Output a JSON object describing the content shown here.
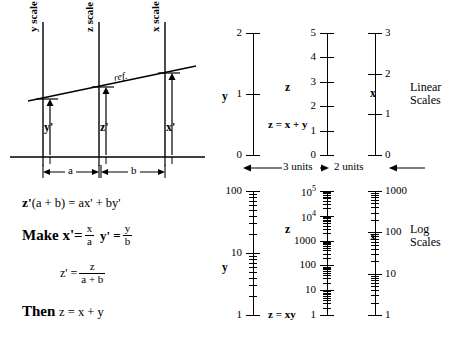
{
  "diagram": {
    "nomogram": {
      "scale_axis_labels": [
        {
          "text": "y scale",
          "variable": "y"
        },
        {
          "text": "z scale",
          "variable": "z"
        },
        {
          "text": "x scale",
          "variable": "x"
        }
      ],
      "reference_line_label": "ref.",
      "arrow_labels": [
        "y'",
        "z'",
        "x'"
      ],
      "dimension_labels": [
        "a",
        "b"
      ]
    },
    "equations": [
      {
        "id": "eq1",
        "text": "z'(a + b) = ax' + by'"
      },
      {
        "id": "eq2",
        "lead": "Make",
        "text": "x'= x/a   y' = y/b"
      },
      {
        "id": "eq3",
        "text": "z' = z/(a + b)"
      },
      {
        "id": "eq4",
        "lead": "Then",
        "text": "z = x + y"
      }
    ],
    "equation_parts": {
      "eq1_zprime": "z'",
      "eq1_rest": "(a + b) = ax' + by'",
      "eq2_make": "Make",
      "eq2_xprime": "x'=",
      "eq2_x_num": "x",
      "eq2_a_den": "a",
      "eq2_yprime": "y' =",
      "eq2_y_num": "y",
      "eq2_b_den": "b",
      "eq3_zprime": "z' =",
      "eq3_num": "z",
      "eq3_den": "a + b",
      "eq4_then": "Then",
      "eq4_rel": "z = x + y"
    }
  },
  "linear_scales": {
    "title": "Linear\nScales",
    "title_line1": "Linear",
    "title_line2": "Scales",
    "relation": "z = x + y",
    "span_left": "3 units",
    "span_right": "2 units",
    "axes": [
      {
        "variable": "y",
        "label_side": "left",
        "ticks": [
          {
            "value": 0,
            "label": "0"
          },
          {
            "value": 1,
            "label": "1"
          },
          {
            "value": 2,
            "label": "2"
          }
        ],
        "range": [
          0,
          2
        ]
      },
      {
        "variable": "z",
        "label_side": "left",
        "ticks": [
          {
            "value": 0,
            "label": "0"
          },
          {
            "value": 1,
            "label": "1"
          },
          {
            "value": 2,
            "label": "2"
          },
          {
            "value": 3,
            "label": "3"
          },
          {
            "value": 4,
            "label": "4"
          },
          {
            "value": 5,
            "label": "5"
          }
        ],
        "range": [
          0,
          5
        ]
      },
      {
        "variable": "x",
        "label_side": "right",
        "ticks": [
          {
            "value": 0,
            "label": "0"
          },
          {
            "value": 1,
            "label": "1"
          },
          {
            "value": 2,
            "label": "2"
          },
          {
            "value": 3,
            "label": "3"
          }
        ],
        "range": [
          0,
          3
        ]
      }
    ]
  },
  "log_scales": {
    "title_line1": "Log",
    "title_line2": "Scales",
    "relation": "z = xy",
    "axes": [
      {
        "variable": "y",
        "label_side": "left",
        "decades": 2,
        "ticks": [
          {
            "value": 1,
            "label": "1"
          },
          {
            "value": 10,
            "label": "10"
          },
          {
            "value": 100,
            "label": "100"
          }
        ]
      },
      {
        "variable": "z",
        "label_side": "left",
        "decades": 5,
        "ticks": [
          {
            "value": 1,
            "label": "1"
          },
          {
            "value": 10,
            "label": "10"
          },
          {
            "value": 100,
            "label": "100"
          },
          {
            "value": 1000,
            "label": "1000"
          },
          {
            "value": 10000,
            "label": "10",
            "exponent": "4"
          },
          {
            "value": 100000,
            "label": "10",
            "exponent": "5"
          }
        ]
      },
      {
        "variable": "x",
        "label_side": "right",
        "decades": 3,
        "ticks": [
          {
            "value": 1,
            "label": "1"
          },
          {
            "value": 10,
            "label": "10"
          },
          {
            "value": 100,
            "label": "100"
          },
          {
            "value": 1000,
            "label": "1000"
          }
        ]
      }
    ]
  },
  "colors": {
    "ink": "#000000",
    "background": "#ffffff"
  }
}
